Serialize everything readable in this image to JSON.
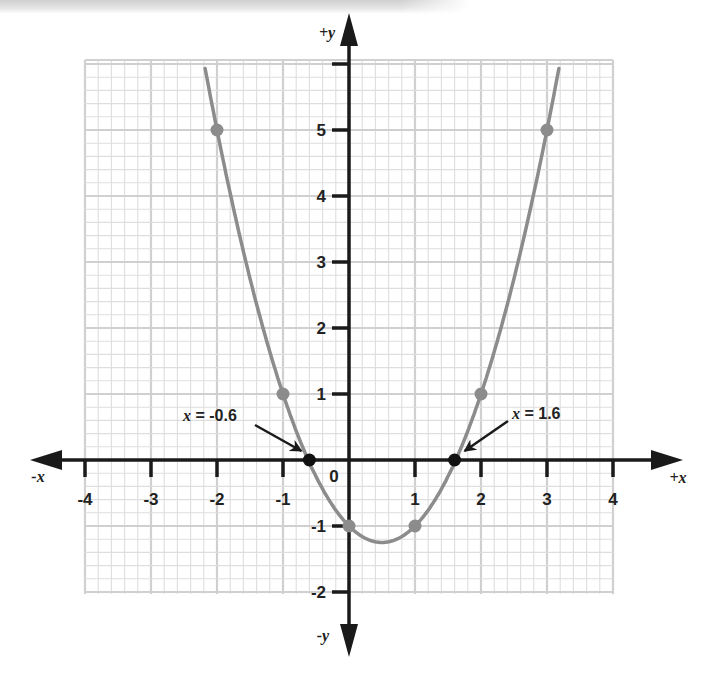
{
  "chart_data": {
    "type": "line",
    "title": "",
    "function": "y = x^2 - x - 1",
    "xlabel_positive": "+x",
    "xlabel_negative": "-x",
    "ylabel_positive": "+y",
    "ylabel_negative": "-y",
    "xlim": [
      -4,
      4
    ],
    "ylim": [
      -2,
      6
    ],
    "grid": true,
    "grid_minor_step": 0.2,
    "grid_major_step": 1,
    "x_ticks": [
      -4,
      -3,
      -2,
      -1,
      1,
      2,
      3,
      4
    ],
    "x_tick_labels": [
      "-4",
      "-3",
      "-2",
      "-1",
      "1",
      "2",
      "3",
      "4"
    ],
    "y_ticks": [
      -2,
      -1,
      1,
      2,
      3,
      4,
      5,
      6
    ],
    "y_tick_labels": [
      "-2",
      "-1",
      "1",
      "2",
      "3",
      "4",
      "5",
      ""
    ],
    "origin_label": "0",
    "curve_x_range": [
      -2.18,
      3.18
    ],
    "series": [
      {
        "name": "table points",
        "color": "#8c8c8c",
        "x": [
          -2,
          -1,
          0,
          1,
          2,
          3
        ],
        "y": [
          5,
          1,
          -1,
          -1,
          1,
          5
        ]
      },
      {
        "name": "x-intercepts",
        "color": "#111111",
        "x": [
          -0.6,
          1.6
        ],
        "y": [
          0,
          0
        ]
      }
    ],
    "annotations": [
      {
        "text": "x = -0.6",
        "x_part": "x",
        "value_part": " = -0.6",
        "points_to": [
          -0.6,
          0
        ]
      },
      {
        "text": "x = 1.6",
        "x_part": "x",
        "value_part": " = 1.6",
        "points_to": [
          1.6,
          0
        ]
      }
    ],
    "colors": {
      "curve": "#8c8c8c",
      "axis": "#1a1a1a",
      "grid_minor": "#dedede",
      "grid_major": "#d0d0d0",
      "intercept_point": "#111111"
    }
  }
}
